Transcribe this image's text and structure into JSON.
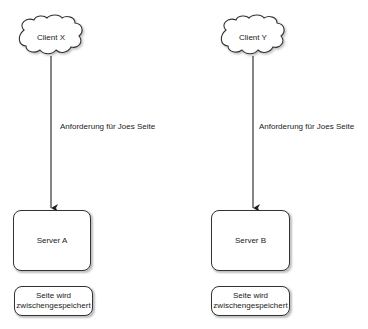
{
  "diagram": {
    "left": {
      "client_label": "Client X",
      "edge_label": "Anforderung für Joes Seite",
      "server_label": "Server A",
      "note_line1": "Seite wird",
      "note_line2": "zwischengespeichert"
    },
    "right": {
      "client_label": "Client Y",
      "edge_label": "Anforderung für Joes Seite",
      "server_label": "Server B",
      "note_line1": "Seite wird",
      "note_line2": "zwischengespeichert"
    }
  }
}
